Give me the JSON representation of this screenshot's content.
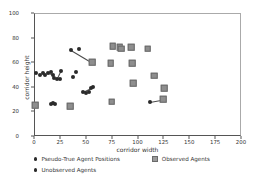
{
  "chart_data": {
    "type": "scatter",
    "title": "",
    "xlabel": "corridor width",
    "ylabel": "corridor height",
    "xlim": [
      0,
      200
    ],
    "ylim": [
      0,
      100
    ],
    "xticks": [
      0,
      25,
      50,
      75,
      100,
      125,
      150,
      175,
      200
    ],
    "yticks": [
      0,
      20,
      40,
      60,
      80,
      100
    ],
    "grid": false,
    "legend_position": "below-axes",
    "legend": [
      {
        "label": "Pseudo-True Agent Positions",
        "marker": "dot",
        "color": "#2b2b2b"
      },
      {
        "label": "Observed Agents",
        "marker": "square",
        "color": "#8e8e8e"
      },
      {
        "label": "Unobserved Agents",
        "marker": "dot",
        "color": "#2b2b2b"
      }
    ],
    "series": [
      {
        "name": "Pseudo-True Agent Positions",
        "marker": "dot",
        "points": [
          [
            2,
            51
          ],
          [
            6,
            50
          ],
          [
            9,
            51
          ],
          [
            11,
            50
          ],
          [
            14,
            51
          ],
          [
            16,
            52
          ],
          [
            18,
            50
          ],
          [
            19,
            47
          ],
          [
            22,
            46
          ],
          [
            25,
            46
          ],
          [
            26,
            53
          ],
          [
            36,
            70
          ],
          [
            43,
            71
          ],
          [
            38,
            48
          ],
          [
            41,
            52
          ],
          [
            47,
            36
          ],
          [
            50,
            35
          ],
          [
            53,
            36
          ],
          [
            55,
            39
          ],
          [
            57,
            40
          ],
          [
            16,
            26
          ],
          [
            18,
            27
          ],
          [
            20,
            26
          ],
          [
            112,
            28
          ]
        ]
      },
      {
        "name": "Observed Agents",
        "marker": "square",
        "points": [
          [
            1,
            25
          ],
          [
            35,
            24
          ],
          [
            56,
            60
          ],
          [
            74,
            59
          ],
          [
            75,
            28
          ],
          [
            76,
            73
          ],
          [
            83,
            72
          ],
          [
            84,
            71
          ],
          [
            94,
            72
          ],
          [
            95,
            59
          ],
          [
            96,
            43
          ],
          [
            110,
            71
          ],
          [
            116,
            49
          ],
          [
            125,
            30
          ],
          [
            126,
            39
          ]
        ]
      }
    ],
    "connections": [
      [
        [
          36,
          70
        ],
        [
          56,
          60
        ]
      ],
      [
        [
          112,
          28
        ],
        [
          125,
          30
        ]
      ],
      [
        [
          16,
          26
        ],
        [
          20,
          26
        ]
      ],
      [
        [
          22,
          46
        ],
        [
          26,
          53
        ]
      ],
      [
        [
          47,
          36
        ],
        [
          57,
          40
        ]
      ],
      [
        [
          14,
          51
        ],
        [
          18,
          50
        ]
      ]
    ]
  }
}
